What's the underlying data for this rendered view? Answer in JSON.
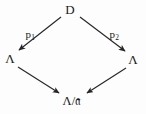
{
  "diagram": {
    "type": "commutative-diagram",
    "shape": "diamond",
    "background_color": "#fdfdfd",
    "stroke_color": "#262626",
    "text_color": "#1a1a1a",
    "nodes": [
      {
        "id": "top",
        "label": "D",
        "x": 70,
        "y": 9
      },
      {
        "id": "left",
        "label": "Λ",
        "x": 10,
        "y": 58
      },
      {
        "id": "right",
        "label": "Λ",
        "x": 133,
        "y": 59
      },
      {
        "id": "bottom",
        "label": "Λ/𝔞",
        "x": 72,
        "y": 101
      }
    ],
    "edges": [
      {
        "id": "edge-top-left",
        "from": "top",
        "to": "left",
        "label_text": "p",
        "label_sub": "1",
        "label_x": 30,
        "label_y": 34,
        "arrowhead": "end"
      },
      {
        "id": "edge-top-right",
        "from": "top",
        "to": "right",
        "label_text": "p",
        "label_sub": "2",
        "label_x": 114,
        "label_y": 34,
        "arrowhead": "end"
      },
      {
        "id": "edge-left-bottom",
        "from": "left",
        "to": "bottom",
        "label_text": "",
        "label_sub": "",
        "label_x": 0,
        "label_y": 0,
        "arrowhead": "end"
      },
      {
        "id": "edge-right-bottom",
        "from": "right",
        "to": "bottom",
        "label_text": "",
        "label_sub": "",
        "label_x": 0,
        "label_y": 0,
        "arrowhead": "end"
      }
    ]
  }
}
